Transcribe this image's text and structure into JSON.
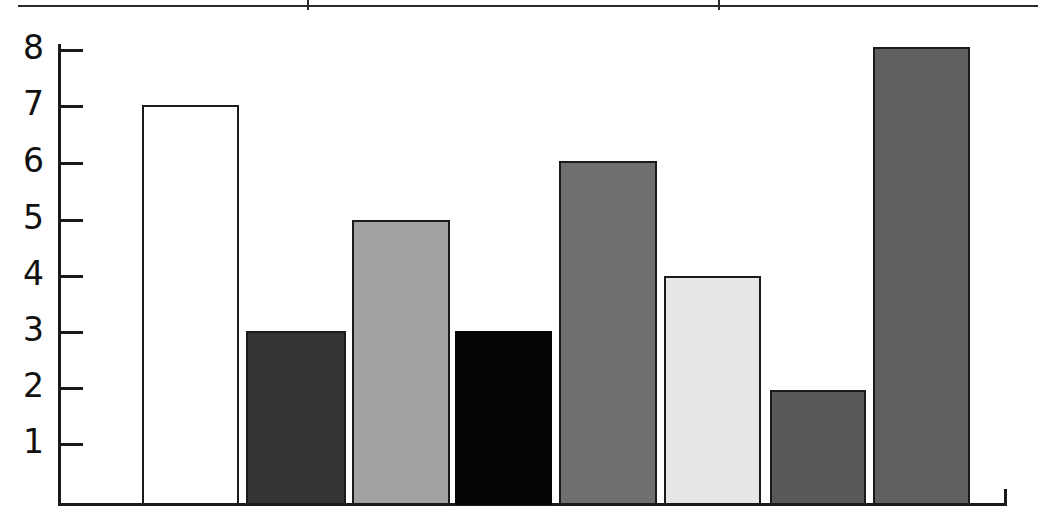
{
  "figure": {
    "width": 1038,
    "height": 531,
    "background": "#ffffff"
  },
  "top_rule": {
    "name": "page-border-rule",
    "ticks": [
      307,
      718
    ],
    "color": "#2a2a2a"
  },
  "axis": {
    "color": "#1a1a1a",
    "baseline_y": 503,
    "y_axis_x": 58,
    "pixels_per_unit": 56.3,
    "end_tick_x": 1005
  },
  "chart_data": {
    "type": "bar",
    "title": "",
    "subtitle": "",
    "xlabel": "",
    "ylabel": "",
    "categories": [
      "1",
      "2",
      "3",
      "4",
      "5",
      "6",
      "7",
      "8"
    ],
    "values": [
      7,
      3,
      5,
      3,
      6,
      4,
      2,
      8
    ],
    "ylim": [
      0,
      8
    ],
    "xlim": [
      0,
      8
    ],
    "yticks": [
      1,
      2,
      3,
      4,
      5,
      6,
      7,
      8
    ],
    "ytick_labels": [
      "1",
      "2",
      "3",
      "4",
      "5",
      "6",
      "7",
      "8"
    ],
    "xtick_labels": [],
    "grid": false,
    "legend": false,
    "legend_position": "none",
    "annotations": [],
    "bars": [
      {
        "index": 1,
        "value": 7,
        "fill": "#ffffff",
        "edge": "#1b1b1b",
        "fill_name": "white",
        "x": 142,
        "width": 97,
        "top": 105
      },
      {
        "index": 2,
        "value": 3,
        "fill": "#343434",
        "edge": "#1b1b1b",
        "fill_name": "dark-gray",
        "x": 246,
        "width": 100,
        "top": 331
      },
      {
        "index": 3,
        "value": 5,
        "fill": "#a2a2a2",
        "edge": "#1b1b1b",
        "fill_name": "light-mid-gray",
        "x": 352,
        "width": 98,
        "top": 220
      },
      {
        "index": 4,
        "value": 3,
        "fill": "#050505",
        "edge": "#050505",
        "fill_name": "black",
        "x": 455,
        "width": 97,
        "top": 331
      },
      {
        "index": 5,
        "value": 6,
        "fill": "#6f6f6f",
        "edge": "#1b1b1b",
        "fill_name": "mid-gray",
        "x": 559,
        "width": 98,
        "top": 161
      },
      {
        "index": 6,
        "value": 4,
        "fill": "#e7e7e7",
        "edge": "#1b1b1b",
        "fill_name": "very-light-gray",
        "x": 664,
        "width": 97,
        "top": 276
      },
      {
        "index": 7,
        "value": 2,
        "fill": "#585858",
        "edge": "#1b1b1b",
        "fill_name": "dark-mid-gray",
        "x": 770,
        "width": 96,
        "top": 390
      },
      {
        "index": 8,
        "value": 8,
        "fill": "#606060",
        "edge": "#1b1b1b",
        "fill_name": "mid-dark-gray",
        "x": 873,
        "width": 97,
        "top": 47
      }
    ],
    "ytick_pixels": [
      443,
      387,
      331,
      275,
      219,
      162,
      105,
      49
    ]
  }
}
